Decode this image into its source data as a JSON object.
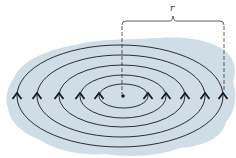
{
  "diagram": {
    "colors": {
      "background": "#ffffff",
      "region_fill": "#cfdde6",
      "line": "#1a1a1a",
      "dimension": "#333333"
    },
    "center_point": {
      "x": 123,
      "y": 96,
      "r": 1.8
    },
    "region_blob_path": "M 14 78 C 20 62, 45 50, 75 45 C 100 38, 130 40, 160 38 C 190 36, 215 42, 226 52 C 236 60, 236 72, 233 82 C 238 95, 235 112, 226 122 C 222 138, 205 146, 180 148 C 160 156, 130 158, 105 154 C 80 156, 55 150, 40 140 C 25 134, 10 124, 8 108 C 4 98, 8 86, 14 78 Z",
    "field_lines": [
      {
        "id": "ring-1",
        "cx": 123.5,
        "cy": 96,
        "rx": 24.5,
        "ry": 12
      },
      {
        "id": "ring-2",
        "cx": 123,
        "cy": 96.5,
        "rx": 43,
        "ry": 21.5
      },
      {
        "id": "ring-3",
        "cx": 122,
        "cy": 96,
        "rx": 63,
        "ry": 31
      },
      {
        "id": "ring-4",
        "cx": 121,
        "cy": 96,
        "rx": 84,
        "ry": 41
      },
      {
        "id": "ring-5",
        "cx": 120,
        "cy": 96,
        "rx": 103,
        "ry": 51
      }
    ],
    "arrows": [
      {
        "x": 17,
        "y": 96
      },
      {
        "x": 37,
        "y": 96
      },
      {
        "x": 59,
        "y": 96
      },
      {
        "x": 80,
        "y": 96
      },
      {
        "x": 99,
        "y": 96
      },
      {
        "x": 148,
        "y": 96
      },
      {
        "x": 166,
        "y": 96
      },
      {
        "x": 185,
        "y": 96
      },
      {
        "x": 205,
        "y": 96
      },
      {
        "x": 223,
        "y": 96
      }
    ],
    "arrow_direction": "up",
    "radius_marker": {
      "label": "r",
      "left_x": 122,
      "right_x": 224,
      "bracket_y": 21,
      "brace_tip": {
        "x": 173,
        "y": 16
      },
      "label_pos": {
        "x": 170,
        "y": 4
      },
      "left_dash_end_y": 94,
      "right_dash_end_y": 92
    }
  }
}
